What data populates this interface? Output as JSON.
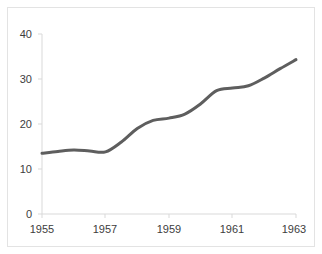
{
  "chart_data": {
    "type": "line",
    "title": "",
    "subtitle": "",
    "xlabel": "",
    "ylabel": "",
    "x": [
      1955,
      1955.5,
      1956,
      1956.5,
      1957,
      1957.5,
      1958,
      1958.5,
      1959,
      1959.5,
      1960,
      1960.5,
      1961,
      1961.5,
      1962,
      1962.5,
      1963
    ],
    "values": [
      13.5,
      13.9,
      14.2,
      14.0,
      13.8,
      16.0,
      19.0,
      20.8,
      21.3,
      22.2,
      24.5,
      27.4,
      28.0,
      28.5,
      30.2,
      32.3,
      34.3
    ],
    "series": [
      {
        "name": "series-1",
        "color": "#5e5e5e",
        "values": [
          13.5,
          13.9,
          14.2,
          14.0,
          13.8,
          16.0,
          19.0,
          20.8,
          21.3,
          22.2,
          24.5,
          27.4,
          28.0,
          28.5,
          30.2,
          32.3,
          34.3
        ]
      }
    ],
    "xlim": [
      1955,
      1963
    ],
    "ylim": [
      0,
      40
    ],
    "xticks": [
      1955,
      1957,
      1959,
      1961,
      1963
    ],
    "xtick_labels": [
      "1955",
      "1957",
      "1959",
      "1961",
      "1963"
    ],
    "yticks": [
      0,
      10,
      20,
      30,
      40
    ],
    "ytick_labels": [
      "0",
      "10",
      "20",
      "30",
      "40"
    ],
    "grid": false,
    "legend": null,
    "legend_position": "none",
    "line_color": "#5e5e5e",
    "line_width": 3,
    "axis_color": "#d9d9d9",
    "background_color": "#ffffff",
    "border_color": "#e3e3e3",
    "text_color": "#3d3d3d"
  },
  "axes": {
    "y_labels": [
      "40",
      "30",
      "20",
      "10",
      "0"
    ],
    "x_labels": [
      "1955",
      "1957",
      "1959",
      "1961",
      "1963"
    ]
  }
}
